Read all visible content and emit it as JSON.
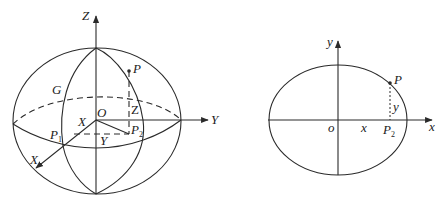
{
  "left_figure": {
    "title": "3D ellipsoid with coordinate axes",
    "axis_labels": {
      "z": "Z",
      "y": "Y",
      "x": "X"
    },
    "points": {
      "origin": "O",
      "P": "P",
      "P1_base": "P",
      "P1_sub": "1",
      "P2_base": "P",
      "P2_sub": "2",
      "G": "G"
    },
    "segment_labels": {
      "x": "X",
      "y": "Y",
      "z": "Z"
    }
  },
  "right_figure": {
    "title": "2D ellipse cross-section",
    "axis_labels": {
      "x": "x",
      "y": "y"
    },
    "points": {
      "origin": "o",
      "P": "P",
      "P2_base": "P",
      "P2_sub": "2"
    },
    "segment_labels": {
      "x": "x",
      "y": "y"
    }
  },
  "colors": {
    "line": "#2a2a2a",
    "background": "#ffffff"
  }
}
